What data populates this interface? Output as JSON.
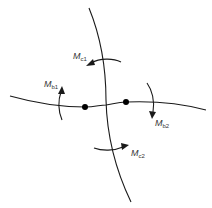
{
  "diagram": {
    "type": "structural-frame-joint-moments",
    "members": [
      {
        "name": "column",
        "orientation": "vertical"
      },
      {
        "name": "beam",
        "orientation": "horizontal"
      }
    ],
    "joints": [
      {
        "name": "joint-left"
      },
      {
        "name": "joint-right"
      }
    ],
    "moments": [
      {
        "id": "Mc1",
        "symbol": "M",
        "subscript": "c1",
        "location": "column-top",
        "arrow_direction": "left"
      },
      {
        "id": "Mb1",
        "symbol": "M",
        "subscript": "b1",
        "location": "beam-left",
        "arrow_direction": "up"
      },
      {
        "id": "Mb2",
        "symbol": "M",
        "subscript": "b2",
        "location": "beam-right",
        "arrow_direction": "down"
      },
      {
        "id": "Mc2",
        "symbol": "M",
        "subscript": "c2",
        "location": "column-bottom",
        "arrow_direction": "right"
      }
    ]
  }
}
